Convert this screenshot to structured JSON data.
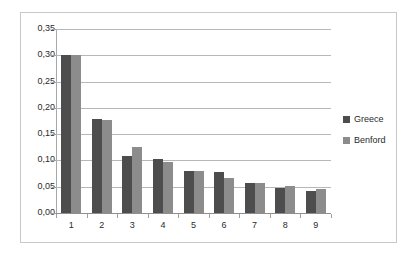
{
  "chart_data": {
    "type": "bar",
    "title": "",
    "subtitle": "",
    "xlabel": "",
    "ylabel": "",
    "categories": [
      "1",
      "2",
      "3",
      "4",
      "5",
      "6",
      "7",
      "8",
      "9"
    ],
    "series": [
      {
        "name": "Greece",
        "color": "#4d4d4d",
        "values": [
          0.301,
          0.178,
          0.109,
          0.103,
          0.079,
          0.078,
          0.058,
          0.047,
          0.042
        ]
      },
      {
        "name": "Benford",
        "color": "#8c8c8c",
        "values": [
          0.301,
          0.176,
          0.125,
          0.097,
          0.079,
          0.067,
          0.058,
          0.051,
          0.046
        ]
      }
    ],
    "ylim": [
      0.0,
      0.35
    ],
    "ytick_step": 0.05,
    "ytick_labels": [
      "0,00",
      "0,05",
      "0,10",
      "0,15",
      "0,20",
      "0,25",
      "0,30",
      "0,35"
    ],
    "ytick_values": [
      0.0,
      0.05,
      0.1,
      0.15,
      0.2,
      0.25,
      0.3,
      0.35
    ],
    "xtick_labels": [
      "1",
      "2",
      "3",
      "4",
      "5",
      "6",
      "7",
      "8",
      "9"
    ],
    "grid": "horizontal",
    "legend_position": "right",
    "decimal_separator": ","
  },
  "legend": {
    "entries": [
      {
        "label": "Greece",
        "color": "#4d4d4d",
        "swatch_name": "legend-swatch-greece"
      },
      {
        "label": "Benford",
        "color": "#8c8c8c",
        "swatch_name": "legend-swatch-benford"
      }
    ]
  },
  "colors": {
    "series_greece": "#4d4d4d",
    "series_benford": "#8c8c8c",
    "gridline": "#b7b7b7",
    "axis": "#a0a0a0",
    "frame_border": "#c9c9c9",
    "background": "#ffffff",
    "text": "#2b2b2b"
  }
}
